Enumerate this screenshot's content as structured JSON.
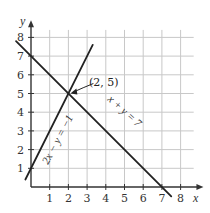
{
  "chart_data": {
    "type": "line",
    "title": "",
    "xlabel": "x",
    "ylabel": "y",
    "xlim": [
      0,
      8
    ],
    "ylim": [
      0,
      8
    ],
    "grid": true,
    "x_ticks": [
      "1",
      "2",
      "3",
      "4",
      "5",
      "6",
      "7",
      "8"
    ],
    "y_ticks": [
      "1",
      "2",
      "3",
      "4",
      "5",
      "6",
      "7",
      "8"
    ],
    "series": [
      {
        "name": "x + y = 7",
        "label": "x + y = 7",
        "x": [
          -0.8,
          7.5
        ],
        "y": [
          7.8,
          -0.5
        ]
      },
      {
        "name": "2x - y = -1",
        "label": "2x − y = −1",
        "x": [
          -0.3,
          3.3
        ],
        "y": [
          0.4,
          7.6
        ]
      }
    ],
    "annotations": [
      {
        "text": "(2, 5)",
        "x": 2,
        "y": 5,
        "arrow": true
      }
    ],
    "colors": {
      "line": "#222222",
      "grid": "#c8c8c8",
      "axis": "#333333"
    }
  }
}
